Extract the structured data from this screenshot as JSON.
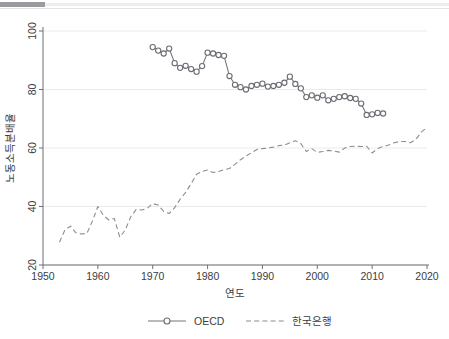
{
  "header": {
    "rule_accent_color": "#9a9a9f",
    "rule_track_color": "#ededf0"
  },
  "chart_data": {
    "type": "line",
    "title": "",
    "xlabel": "연도",
    "ylabel": "노동소득분배율",
    "xlim": [
      1950,
      2020
    ],
    "ylim": [
      20,
      100
    ],
    "xticks": [
      1950,
      1960,
      1970,
      1980,
      1990,
      2000,
      2010,
      2020
    ],
    "yticks": [
      20,
      40,
      60,
      80,
      100
    ],
    "grid": "horizontal",
    "legend_position": "bottom",
    "colors": {
      "oecd": "#76767c",
      "bok": "#8c8c93",
      "grid": "#ebebee",
      "axis": "#6f6f74",
      "text": "#3c3c41"
    },
    "series": [
      {
        "name": "OECD",
        "style": "solid-with-circle-markers",
        "x": [
          1970,
          1971,
          1972,
          1973,
          1974,
          1975,
          1976,
          1977,
          1978,
          1979,
          1980,
          1981,
          1982,
          1983,
          1984,
          1985,
          1986,
          1987,
          1988,
          1989,
          1990,
          1991,
          1992,
          1993,
          1994,
          1995,
          1996,
          1997,
          1998,
          1999,
          2000,
          2001,
          2002,
          2003,
          2004,
          2005,
          2006,
          2007,
          2008,
          2009,
          2010,
          2011,
          2012
        ],
        "values": [
          94.5,
          93.3,
          92.3,
          94.0,
          89.0,
          87.4,
          88.1,
          87.0,
          86.1,
          88.0,
          92.6,
          92.3,
          91.8,
          91.5,
          84.6,
          81.6,
          80.8,
          80.0,
          81.2,
          81.6,
          82.0,
          81.0,
          81.2,
          81.6,
          82.3,
          84.4,
          81.9,
          80.4,
          77.4,
          78.0,
          77.2,
          78.0,
          76.3,
          76.8,
          77.4,
          77.7,
          77.1,
          76.8,
          75.2,
          71.3,
          71.5,
          72.0,
          71.8
        ]
      },
      {
        "name": "한국은행",
        "style": "dashed",
        "x": [
          1953,
          1954,
          1955,
          1956,
          1957,
          1958,
          1959,
          1960,
          1961,
          1962,
          1963,
          1964,
          1965,
          1966,
          1967,
          1968,
          1969,
          1970,
          1971,
          1972,
          1973,
          1974,
          1975,
          1976,
          1977,
          1978,
          1979,
          1980,
          1981,
          1982,
          1983,
          1984,
          1985,
          1986,
          1987,
          1988,
          1989,
          1990,
          1991,
          1992,
          1993,
          1994,
          1995,
          1996,
          1997,
          1998,
          1999,
          2000,
          2001,
          2002,
          2003,
          2004,
          2005,
          2006,
          2007,
          2008,
          2009,
          2010,
          2011,
          2012,
          2013,
          2014,
          2015,
          2016,
          2017,
          2018,
          2019,
          2020
        ],
        "values": [
          27.8,
          32.0,
          33.3,
          31.0,
          30.6,
          30.8,
          35.0,
          40.0,
          37.0,
          35.4,
          35.9,
          29.5,
          32.0,
          36.5,
          39.0,
          38.8,
          39.4,
          41.0,
          40.5,
          38.3,
          37.6,
          39.6,
          42.5,
          44.8,
          47.8,
          51.0,
          52.0,
          52.5,
          51.6,
          52.0,
          52.6,
          53.0,
          54.4,
          56.0,
          57.2,
          58.4,
          59.5,
          59.8,
          60.0,
          60.3,
          60.8,
          61.0,
          61.8,
          62.5,
          61.5,
          58.8,
          59.8,
          58.5,
          58.8,
          59.2,
          59.0,
          58.6,
          60.0,
          60.5,
          60.6,
          60.5,
          60.6,
          58.3,
          59.8,
          60.5,
          61.0,
          61.8,
          62.2,
          62.2,
          61.8,
          63.0,
          65.5,
          67.0
        ]
      }
    ]
  },
  "legend": {
    "items": [
      {
        "label": "OECD",
        "marker": "line-circle"
      },
      {
        "label": "한국은행",
        "marker": "line-dashed"
      }
    ]
  }
}
